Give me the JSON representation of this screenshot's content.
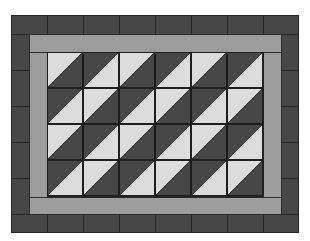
{
  "figure": {
    "colors": {
      "dark": "#474747",
      "light": "#dcdcdc",
      "gray_band": "#9c9c9c",
      "seam": "#222222",
      "background": "#ffffff"
    },
    "outer_border": {
      "top_blocks": 8,
      "bottom_blocks": 8,
      "left_blocks": 5,
      "right_blocks": 5
    },
    "center_field": {
      "rows": 4,
      "columns": 6,
      "cell_style": "half-square triangle, diagonal from bottom-left to top-right",
      "pattern": [
        [
          "light-dark",
          "dark-light",
          "light-dark",
          "dark-light",
          "light-dark",
          "dark-light"
        ],
        [
          "dark-light",
          "light-dark",
          "dark-light",
          "light-dark",
          "dark-light",
          "light-dark"
        ],
        [
          "light-dark",
          "dark-light",
          "light-dark",
          "dark-light",
          "light-dark",
          "dark-light"
        ],
        [
          "dark-light",
          "light-dark",
          "dark-light",
          "light-dark",
          "dark-light",
          "light-dark"
        ]
      ],
      "pattern_legend": "first color = upper-left triangle, second color = lower-right triangle"
    }
  }
}
